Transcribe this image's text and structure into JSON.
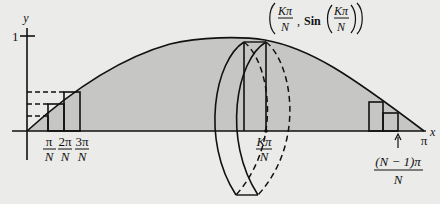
{
  "figure": {
    "colors": {
      "background": "#ebebe9",
      "shaded_region": "#c6c6c4",
      "ink": "#111111"
    },
    "axes": {
      "x_label": "x",
      "y_label": "y",
      "y_tick_label": "1",
      "x_end_label": "π"
    },
    "tick_labels": [
      {
        "num": "π",
        "den": "N"
      },
      {
        "num": "2π",
        "den": "N"
      },
      {
        "num": "3π",
        "den": "N"
      },
      {
        "num": "Kπ",
        "den": "N"
      }
    ],
    "last_label": {
      "num": "(N − 1)π",
      "den": "N"
    },
    "point_label": {
      "x_num": "Kπ",
      "x_den": "N",
      "func": "Sin",
      "arg_num": "Kπ",
      "arg_den": "N",
      "comma": ","
    }
  }
}
